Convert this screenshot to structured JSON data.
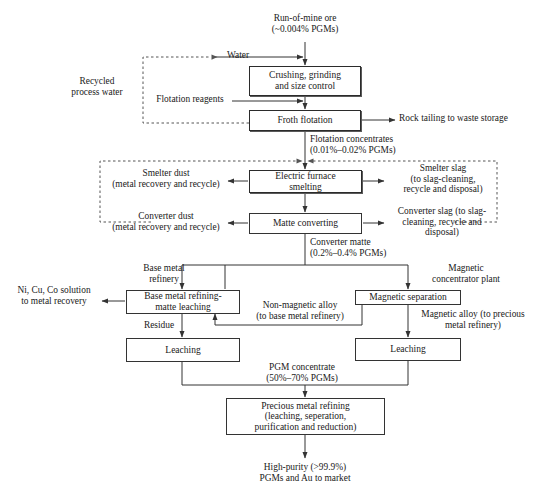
{
  "diagram": {
    "nodes": [
      {
        "id": "crushing",
        "label": "Crushing, grinding\nand size control"
      },
      {
        "id": "froth",
        "label": "Froth flotation"
      },
      {
        "id": "furnace",
        "label": "Electric furnace\nsmelting"
      },
      {
        "id": "matte",
        "label": "Matte converting"
      },
      {
        "id": "bmr",
        "label": "Base metal refining-\nmatte leaching"
      },
      {
        "id": "magsep",
        "label": "Magnetic separation"
      },
      {
        "id": "leach_left",
        "label": "Leaching"
      },
      {
        "id": "leach_right",
        "label": "Leaching"
      },
      {
        "id": "pmr",
        "label": "Precious metal refining\n(leaching, seperation,\npurification and reduction)"
      }
    ],
    "labels": [
      {
        "id": "run-of-mine-ore",
        "text": "Run-of-mine ore\n(~0.004% PGMs)"
      },
      {
        "id": "water",
        "text": "Water"
      },
      {
        "id": "recycled-process-water",
        "text": "Recycled\nprocess water"
      },
      {
        "id": "flotation-reagents",
        "text": "Flotation reagents"
      },
      {
        "id": "rock-tailing",
        "text": "Rock tailing to waste storage"
      },
      {
        "id": "flotation-concentrates",
        "text": "Flotation concentrates\n(0.01%–0.02% PGMs)"
      },
      {
        "id": "smelter-dust",
        "text": "Smelter dust\n(metal recovery and recycle)"
      },
      {
        "id": "smelter-slag",
        "text": "Smelter slag\n(to slag-cleaning,\nrecycle and disposal)"
      },
      {
        "id": "converter-dust",
        "text": "Converter dust\n(metal recovery and recycle)"
      },
      {
        "id": "converter-slag",
        "text": "Converter slag (to slag-\ncleaning, recycle and\ndisposal)"
      },
      {
        "id": "converter-matte",
        "text": "Converter matte\n(0.2%–0.4% PGMs)"
      },
      {
        "id": "base-metal-refinery",
        "text": "Base metal\nrefinery"
      },
      {
        "id": "magnetic-concentrator",
        "text": "Magnetic\nconcentrator plant"
      },
      {
        "id": "ni-cu-co-solution",
        "text": "Ni, Cu, Co solution\nto metal recovery"
      },
      {
        "id": "non-magnetic-alloy",
        "text": "Non-magnetic alloy\n(to base metal refinery)"
      },
      {
        "id": "magnetic-alloy",
        "text": "Magnetic alloy (to precious\nmetal refinery)"
      },
      {
        "id": "residue",
        "text": "Residue"
      },
      {
        "id": "pgm-concentrate",
        "text": "PGM concentrate\n(50%–70% PGMs)"
      },
      {
        "id": "high-purity-output",
        "text": "High-purity (>99.9%)\nPGMs and Au to market"
      }
    ],
    "colors": {
      "line": "#333333",
      "box_border": "#2b2b2b",
      "background": "#ffffff",
      "text": "#1a1a1a"
    }
  }
}
